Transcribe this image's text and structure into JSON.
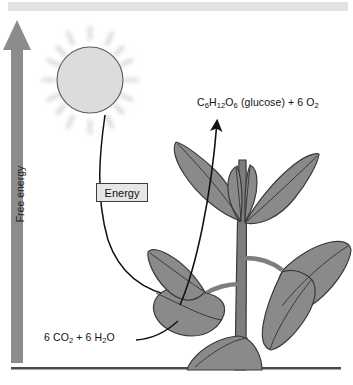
{
  "figure": {
    "background_color": "#ffffff"
  },
  "top_bar": {
    "color": "#e3e3e3"
  },
  "axis": {
    "label": "Free energy",
    "direction": "up",
    "arrow_color": "#8c8c8c",
    "baseline_color": "#4a4a4a"
  },
  "sun": {
    "name": "sun",
    "fill_color": "#dcdcdc",
    "stroke_color": "#555555",
    "ray_color": "#d2d2d2"
  },
  "energy": {
    "label": "Energy",
    "box_fill": "#e6e6e6",
    "box_border": "#3c3c3c",
    "arrow_color": "#111111"
  },
  "labels": {
    "products": "C6H12O6 (glucose) + 6 O2",
    "products_html": "C<sub>6</sub>H<sub>12</sub>O<sub>6</sub> (glucose) + 6 O<sub>2</sub>",
    "reactants": "6 CO2 + 6 H2O",
    "reactants_html": "6 CO<sub>2</sub> + 6 H<sub>2</sub>O"
  },
  "plant": {
    "name": "plant",
    "leaf_fill": "#8a8a8a",
    "leaf_stroke": "#3a3a3a",
    "stem_fill": "#7e7e7e",
    "stem_stroke": "#3a3a3a"
  },
  "arrows": {
    "product_arrow_color": "#111111",
    "energy_arrow_color": "#111111"
  }
}
